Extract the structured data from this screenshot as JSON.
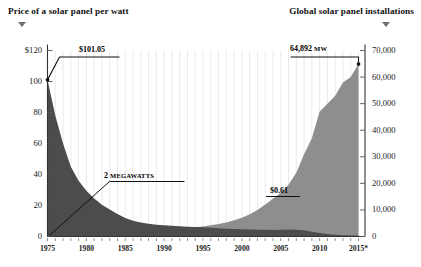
{
  "titles": {
    "left": "Price of a solar panel per watt",
    "right": "Global solar panel installations",
    "left_marker_icon": "triangle-down-icon",
    "right_marker_icon": "triangle-down-icon"
  },
  "annotations": {
    "price_start": "$101.05",
    "price_end": "$0.61",
    "install_start": "2 MEGAWATTS",
    "install_start_value": "2",
    "install_start_unit": "MEGAWATTS",
    "install_end": "64,892",
    "install_end_unit": "MW"
  },
  "colors": {
    "price_area": "#4c4c4c",
    "install_area": "#8e8e8e",
    "gridline": "#e8e8e8",
    "axis": "#333333",
    "text": "#1a1a1a",
    "background": "#ffffff"
  },
  "chart_data": {
    "type": "area",
    "subtitle": "",
    "xlabel": "",
    "ylabel": "Price of a solar panel per watt",
    "y2label": "Global solar panel installations",
    "grid": true,
    "legend_position": "none",
    "xlim": [
      1975,
      2015
    ],
    "ylim": [
      0,
      120
    ],
    "y2lim": [
      0,
      70000
    ],
    "xticks": [
      1975,
      1980,
      1985,
      1990,
      1995,
      2000,
      2005,
      2010,
      2015
    ],
    "xticklabels": [
      "1975",
      "1980",
      "1985",
      "1990",
      "1995",
      "2000",
      "2005",
      "2010",
      "2015*"
    ],
    "yticks": [
      0,
      20,
      40,
      60,
      80,
      100,
      120
    ],
    "yticklabels": [
      "0",
      "20",
      "40",
      "60",
      "80",
      "100",
      "$120"
    ],
    "y2ticks": [
      0,
      10000,
      20000,
      30000,
      40000,
      50000,
      60000,
      70000
    ],
    "y2ticklabels": [
      "0",
      "10,000",
      "20,000",
      "30,000",
      "40,000",
      "50,000",
      "60,000",
      "70,000"
    ],
    "x": [
      1975,
      1976,
      1977,
      1978,
      1979,
      1980,
      1981,
      1982,
      1983,
      1984,
      1985,
      1986,
      1987,
      1988,
      1989,
      1990,
      1991,
      1992,
      1993,
      1994,
      1995,
      1996,
      1997,
      1998,
      1999,
      2000,
      2001,
      2002,
      2003,
      2004,
      2005,
      2006,
      2007,
      2008,
      2009,
      2010,
      2011,
      2012,
      2013,
      2014,
      2015
    ],
    "series": [
      {
        "name": "Price of a solar panel per watt",
        "axis": "left",
        "unit": "USD per watt",
        "values": [
          101.05,
          78.0,
          60.0,
          45.0,
          36.0,
          29.5,
          24.5,
          20.5,
          17.5,
          14.5,
          12.0,
          10.2,
          9.0,
          8.2,
          7.6,
          7.2,
          6.9,
          6.6,
          6.3,
          6.1,
          5.9,
          5.6,
          5.3,
          5.0,
          4.8,
          4.6,
          4.5,
          4.4,
          4.3,
          4.2,
          4.4,
          4.5,
          4.3,
          4.0,
          3.1,
          2.2,
          1.6,
          1.1,
          0.85,
          0.72,
          0.61
        ]
      },
      {
        "name": "Global solar panel installations",
        "axis": "right",
        "unit": "MW",
        "values": [
          2,
          20,
          60,
          130,
          220,
          340,
          470,
          620,
          800,
          1000,
          1250,
          1450,
          1700,
          1900,
          2150,
          2400,
          2650,
          2900,
          3200,
          3500,
          3800,
          4200,
          4700,
          5300,
          6100,
          7100,
          8400,
          10000,
          12000,
          14200,
          16500,
          19500,
          24000,
          31000,
          37000,
          47000,
          50000,
          53000,
          58000,
          60000,
          64892
        ]
      }
    ]
  }
}
